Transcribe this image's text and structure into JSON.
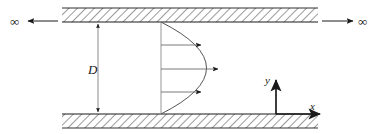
{
  "figure": {
    "type": "engineering-diagram",
    "width": 380,
    "height": 134,
    "background_color": "#ffffff",
    "line_color": "#1a1a1a",
    "hatch_color": "#6e6e6e",
    "profile_color": "#555555"
  },
  "labels": {
    "diameter": "D",
    "axis_x": "x",
    "axis_y": "y",
    "infinity_left": "∞",
    "infinity_right": "∞"
  },
  "walls": {
    "top": {
      "x": 62,
      "y": 8,
      "width": 256,
      "height": 14,
      "fill_label": "hatched-solid-wall"
    },
    "bottom": {
      "x": 62,
      "y": 114,
      "width": 256,
      "height": 14,
      "fill_label": "hatched-solid-wall"
    }
  },
  "dimension": {
    "name": "channel-diameter",
    "label": "D",
    "x": 98,
    "y_top": 22,
    "y_bottom": 114,
    "label_x": 92,
    "label_y": 73
  },
  "velocity_profile": {
    "name": "parabolic-velocity-profile",
    "base_x": 161,
    "top_y": 22,
    "bottom_y": 114,
    "vertex_x": 222,
    "vertex_y": 68,
    "arrows": [
      {
        "y": 45,
        "x_start": 161,
        "x_end": 203
      },
      {
        "y": 69,
        "x_start": 161,
        "x_end": 220
      },
      {
        "y": 92,
        "x_start": 161,
        "x_end": 203
      }
    ]
  },
  "far_field": {
    "left": {
      "symbol": "∞",
      "symbol_x": 10,
      "symbol_y": 25,
      "arrow_y": 21,
      "arrow_x_start": 58,
      "arrow_x_end": 27
    },
    "right": {
      "symbol": "∞",
      "symbol_x": 358,
      "symbol_y": 25,
      "arrow_y": 21,
      "arrow_x_start": 322,
      "arrow_x_end": 354
    }
  },
  "axes": {
    "origin_x": 276,
    "origin_y": 114,
    "x_axis_end": 322,
    "y_axis_end": 78,
    "x_label_pos": {
      "x": 311,
      "y": 109
    },
    "y_label_pos": {
      "x": 265,
      "y": 83
    }
  }
}
